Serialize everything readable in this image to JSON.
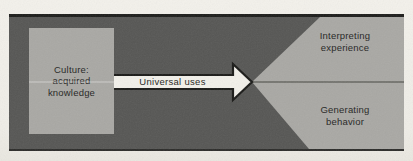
{
  "figure": {
    "source_box": {
      "line1": "Culture:",
      "line2": "acquired",
      "line3": "knowledge"
    },
    "arrow": {
      "label": "Universal uses"
    },
    "outcome_top": {
      "line1": "Interpreting",
      "line2": "experience"
    },
    "outcome_bottom": {
      "line1": "Generating",
      "line2": "behavior"
    },
    "colors": {
      "page_bg": "#f1efe9",
      "panel_bg": "#565654",
      "panel_border": "#1d1d1b",
      "light_gray": "#a9a8a4",
      "arrow_fill": "#f2f0ea",
      "arrow_outline": "#1a1a18",
      "divider_line": "#45453f",
      "text": "#25251f"
    }
  }
}
